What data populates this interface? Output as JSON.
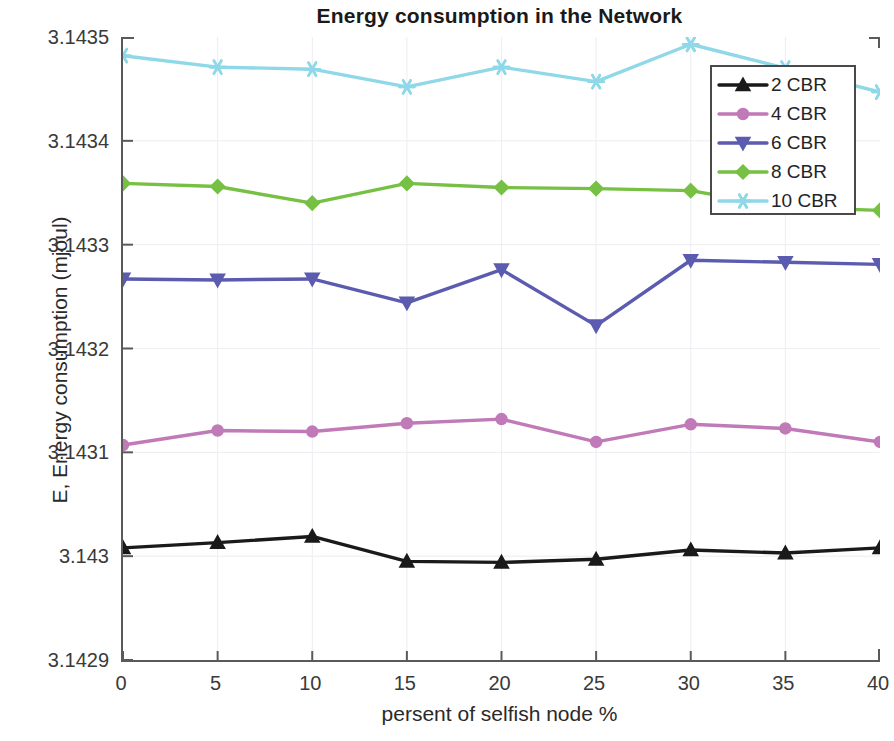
{
  "chart_data": {
    "type": "line",
    "title": "Energy consumption in the Network",
    "xlabel": "persent of selfish node %",
    "ylabel": "E, Energy consumption (mjoul)",
    "x": [
      0,
      5,
      10,
      15,
      20,
      25,
      30,
      35,
      40
    ],
    "xlim": [
      0,
      40
    ],
    "ylim": [
      3.1429,
      3.1435
    ],
    "xticks": [
      "0",
      "5",
      "10",
      "15",
      "20",
      "25",
      "30",
      "35",
      "40"
    ],
    "yticks": [
      "3.1429",
      "3.143",
      "3.1431",
      "3.1432",
      "3.1433",
      "3.1434",
      "3.1435"
    ],
    "grid": true,
    "legend_position": "upper right",
    "series": [
      {
        "name": "2 CBR",
        "color": "#1a1a1a",
        "marker": "triangle-up",
        "values": [
          3.143008,
          3.143013,
          3.143019,
          3.142995,
          3.142994,
          3.142997,
          3.143006,
          3.143003,
          3.143008
        ]
      },
      {
        "name": "4 CBR",
        "color": "#c07ab8",
        "marker": "circle",
        "values": [
          3.143107,
          3.143121,
          3.14312,
          3.143128,
          3.143132,
          3.14311,
          3.143127,
          3.143123,
          3.14311
        ]
      },
      {
        "name": "6 CBR",
        "color": "#5b5bb0",
        "marker": "triangle-down",
        "values": [
          3.143267,
          3.143266,
          3.143267,
          3.143244,
          3.143276,
          3.143222,
          3.143285,
          3.143283,
          3.143281
        ]
      },
      {
        "name": "8 CBR",
        "color": "#76c043",
        "marker": "diamond",
        "values": [
          3.143359,
          3.143356,
          3.14334,
          3.143359,
          3.143355,
          3.143354,
          3.143352,
          3.143336,
          3.143333
        ]
      },
      {
        "name": "10 CBR",
        "color": "#8fd8e8",
        "marker": "star",
        "values": [
          3.143482,
          3.143471,
          3.143469,
          3.143452,
          3.143471,
          3.143457,
          3.143493,
          3.14347,
          3.143447
        ]
      }
    ]
  }
}
